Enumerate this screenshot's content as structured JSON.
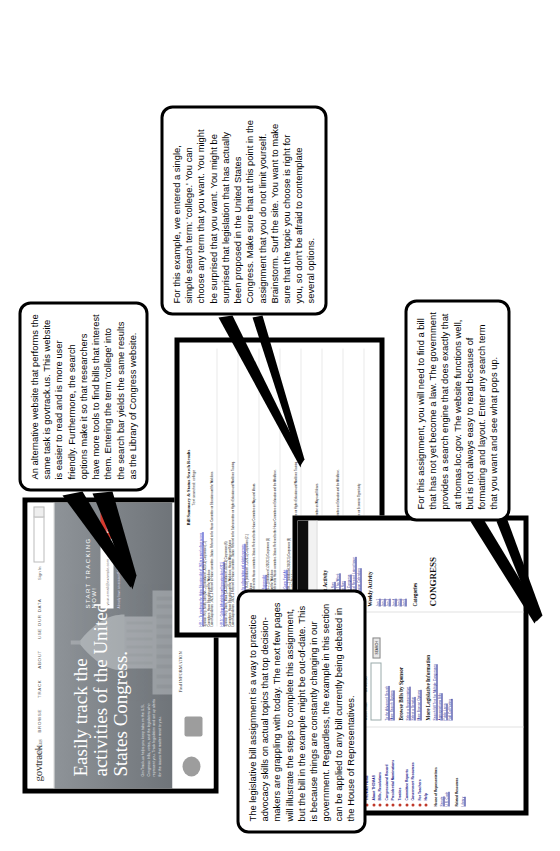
{
  "document": {
    "title": "Legislative Bill Assignment Walkthrough"
  },
  "callouts": {
    "intro": "The legislative bill assignment is a way to practice advocacy skills on actual topics that top decision-makers are grappling with today. The next few pages will illustrate the steps to complete this assignment, but the bill in the example might be out-of-date. This is because things are constantly changing in our government. Regardless, the example in this section can be applied to any bill currently being debated in the House of Representatives.",
    "govtrack": "An alternative website that performs the same task is govtrack.us. This website is easier to read and is more user friendly. Furthermore, the search options make it so that researchers have more tools to find bills that interest them. Entering the term 'college' into the search bar yields the same results as the Library of Congress website.",
    "college": "For this example, we entered a single, simple search term: 'college.' You can choose any term that you want. You might be surprised that you want. You might be surprised that legislation that has actually been proposed in the United States Congress. Make sure that at this point in the assignment that you do not limit yourself. Brainstorm. Surf the site. You want to make sure that the topic you choose is right for you, so don't be afraid to contemplate several options.",
    "thomas": "For this assignment, you will need to find a bill that has not yet become a law. The government provides a search engine that does exactly that at thomas.loc.gov. The website functions well, but is not always easy to read because of formatting and layout. Enter any search term that you want and see what pops up."
  },
  "govtrack": {
    "logo": "govtrack",
    "logo_suffix": ".us",
    "nav": [
      "HOME",
      "BROWSE",
      "TRACK",
      "ABOUT",
      "USE OUR DATA"
    ],
    "signin": "Sign In",
    "search_placeholder": "Search",
    "hero_title": "Easily track the activities of the United States Congress.",
    "hero_body": "GovTrack.us helps you keep tabs on the U.S. Congress: bills, votes, and the legislators who represent you. Track legislation and set up alerts for the issues that matter most to you.",
    "track_heading": "START TRACKING NOW!",
    "track_input_placeholder": "your-email@example.com",
    "track_button": "Register",
    "track_note": "Already have an account? Sign in",
    "find_info": "Find INFORMATION"
  },
  "results": {
    "heading": "Bill Summary & Status Search Results",
    "subheading": "Text searched: college",
    "rows": [
      {
        "title": "H.R.1 : To reauthorize the Higher Education Act of 1965 to expand college access.",
        "meta": "Sponsor: Rep. Smith, John [NY-12] (introduced 1/6/2015)    Cosponsors (14)",
        "committee": "Committees: House Education and the Workforce",
        "status": "Latest Major Action: 1/6/2015 Referred to House committee. Status: Referred to the House Committee on Education and the Workforce."
      },
      {
        "title": "H.R.24 : College Affordability and Innovation Act of 2015",
        "meta": "Sponsor: Rep. Davis, Maria [CA-33] (introduced 1/8/2015)    Cosponsors (6)",
        "committee": "Committees: House Education and the Workforce; House Ways and Means",
        "status": "Latest Major Action: 1/8/2015 Referred to House committee. Status: Referred to the Subcommittee on Higher Education and Workforce Training."
      },
      {
        "title": "H.R.108 : To provide tax credits for college tuition and related expenses.",
        "meta": "Sponsor: Rep. Johnson, Robert [TX-07] (introduced 1/12/2015)    Cosponsors (21)",
        "committee": "Committees: House Ways and Means",
        "status": "Latest Major Action: 1/12/2015 Referred to House committee. Status: Referred to the House Committee on Ways and Means."
      },
      {
        "title": "H.R.237 : College Student Loan Fairness Act",
        "meta": "Sponsor: Rep. Williams, Anne [FL-21] (introduced 1/20/2015)    Cosponsors (3)",
        "committee": "Committees: House Education and the Workforce",
        "status": "Latest Major Action: 1/20/2015 Referred to House committee. Status: Referred to the House Committee on Education and the Workforce."
      },
      {
        "title": "H.R.391 : Community College to Career Fund Act",
        "meta": "Sponsor: Rep. Brown, Michael [OH-11] (introduced 2/3/2015)    Cosponsors (9)",
        "committee": "Committees: House Education and the Workforce",
        "status": "Latest Major Action: 2/3/2015 Referred to House committee. Status: Referred to the Subcommittee on Higher Education and Workforce Training."
      },
      {
        "title": "H.R.452 : To amend the Internal Revenue Code of 1986 regarding college savings plans.",
        "meta": "Sponsor: Rep. Garcia, Luis [AZ-03] (introduced 2/11/2015)    Cosponsors (17)",
        "committee": "Committees: House Ways and Means",
        "status": "Latest Major Action: 2/11/2015 Referred to House committee. Status: Referred to the House Committee on Ways and Means."
      },
      {
        "title": "H.R.510 : College for All Act of 2015",
        "meta": "Sponsor: Rep. Miller, Karen [WA-09] (introduced 2/24/2015)    Cosponsors (32)",
        "committee": "Committees: House Education and the Workforce; House Appropriations",
        "status": "Latest Major Action: 2/24/2015 Referred to House committee. Status: Referred to the House Committee on Education and the Workforce."
      },
      {
        "title": "H.R.688 : Veterans College Tuition Assistance Improvement Act",
        "meta": "Sponsor: Rep. Taylor, James [VA-05] (introduced 3/4/2015)    Cosponsors (11)",
        "committee": "Committees: House Veterans' Affairs",
        "status": "Latest Major Action: 3/4/2015 Referred to House committee. Status: Referred to the Subcommittee on Economic Opportunity."
      }
    ]
  },
  "thomas": {
    "banner": "The LIBRARY of CONGRESS  THOMAS",
    "breadcrumb": "The Library of Congress > THOMAS Home",
    "title": "THOMAS",
    "tagline": "In the spirit of Thomas Jefferson, legislative information from the Library of Congress",
    "nav": [
      "THOMAS Home",
      "About THOMAS",
      "Bills, Resolutions",
      "Congressional Record",
      "Presidential Nominations",
      "Treaties",
      "Committee Reports",
      "Government Resources",
      "For Teachers",
      "Help"
    ],
    "house_section": "House of Representatives",
    "house_links": [
      "Senate",
      "U.S. Code"
    ],
    "related_section": "Related Resources",
    "related_links": [
      "Library"
    ],
    "legislation_label": "Legislation in Current Congress",
    "search_heading": "Search Bill Summary & Status",
    "radio_word": "Word/Phrase",
    "radio_bill": "Bill Number",
    "search_value": "",
    "search_button": "SEARCH",
    "advanced_links": [
      "To the Advanced Search",
      "More Search Options"
    ],
    "browse_heading": "Browse Bills by Sponsor",
    "browse_links": [
      "Select a Representative",
      "Select a Senator",
      "More Browse Options"
    ],
    "legislative_heading": "More Legislative Information",
    "legislative_links": [
      "Search Bill Text for Multiple Congresses",
      "Appropriations Bills",
      "Public Laws",
      "Roll Call Voting"
    ],
    "current_activity_heading": "Current Activity",
    "activity_today": "House Floor Now",
    "activity_links": [
      "House Floor Now",
      "House Floor This Week",
      "Senate Floor Now",
      "Yesterday in Congress",
      "Congressional Record Latest Issue",
      "Days in Session Calendars"
    ],
    "weekly_heading": "Weekly Activity",
    "weekly_rows": [
      "Jan 1",
      "Jan 2",
      "Jan 3",
      "Jan 4",
      "Jan 5",
      "Jan 6"
    ],
    "categories_heading": "Categories",
    "footer": "CONGRESS"
  }
}
